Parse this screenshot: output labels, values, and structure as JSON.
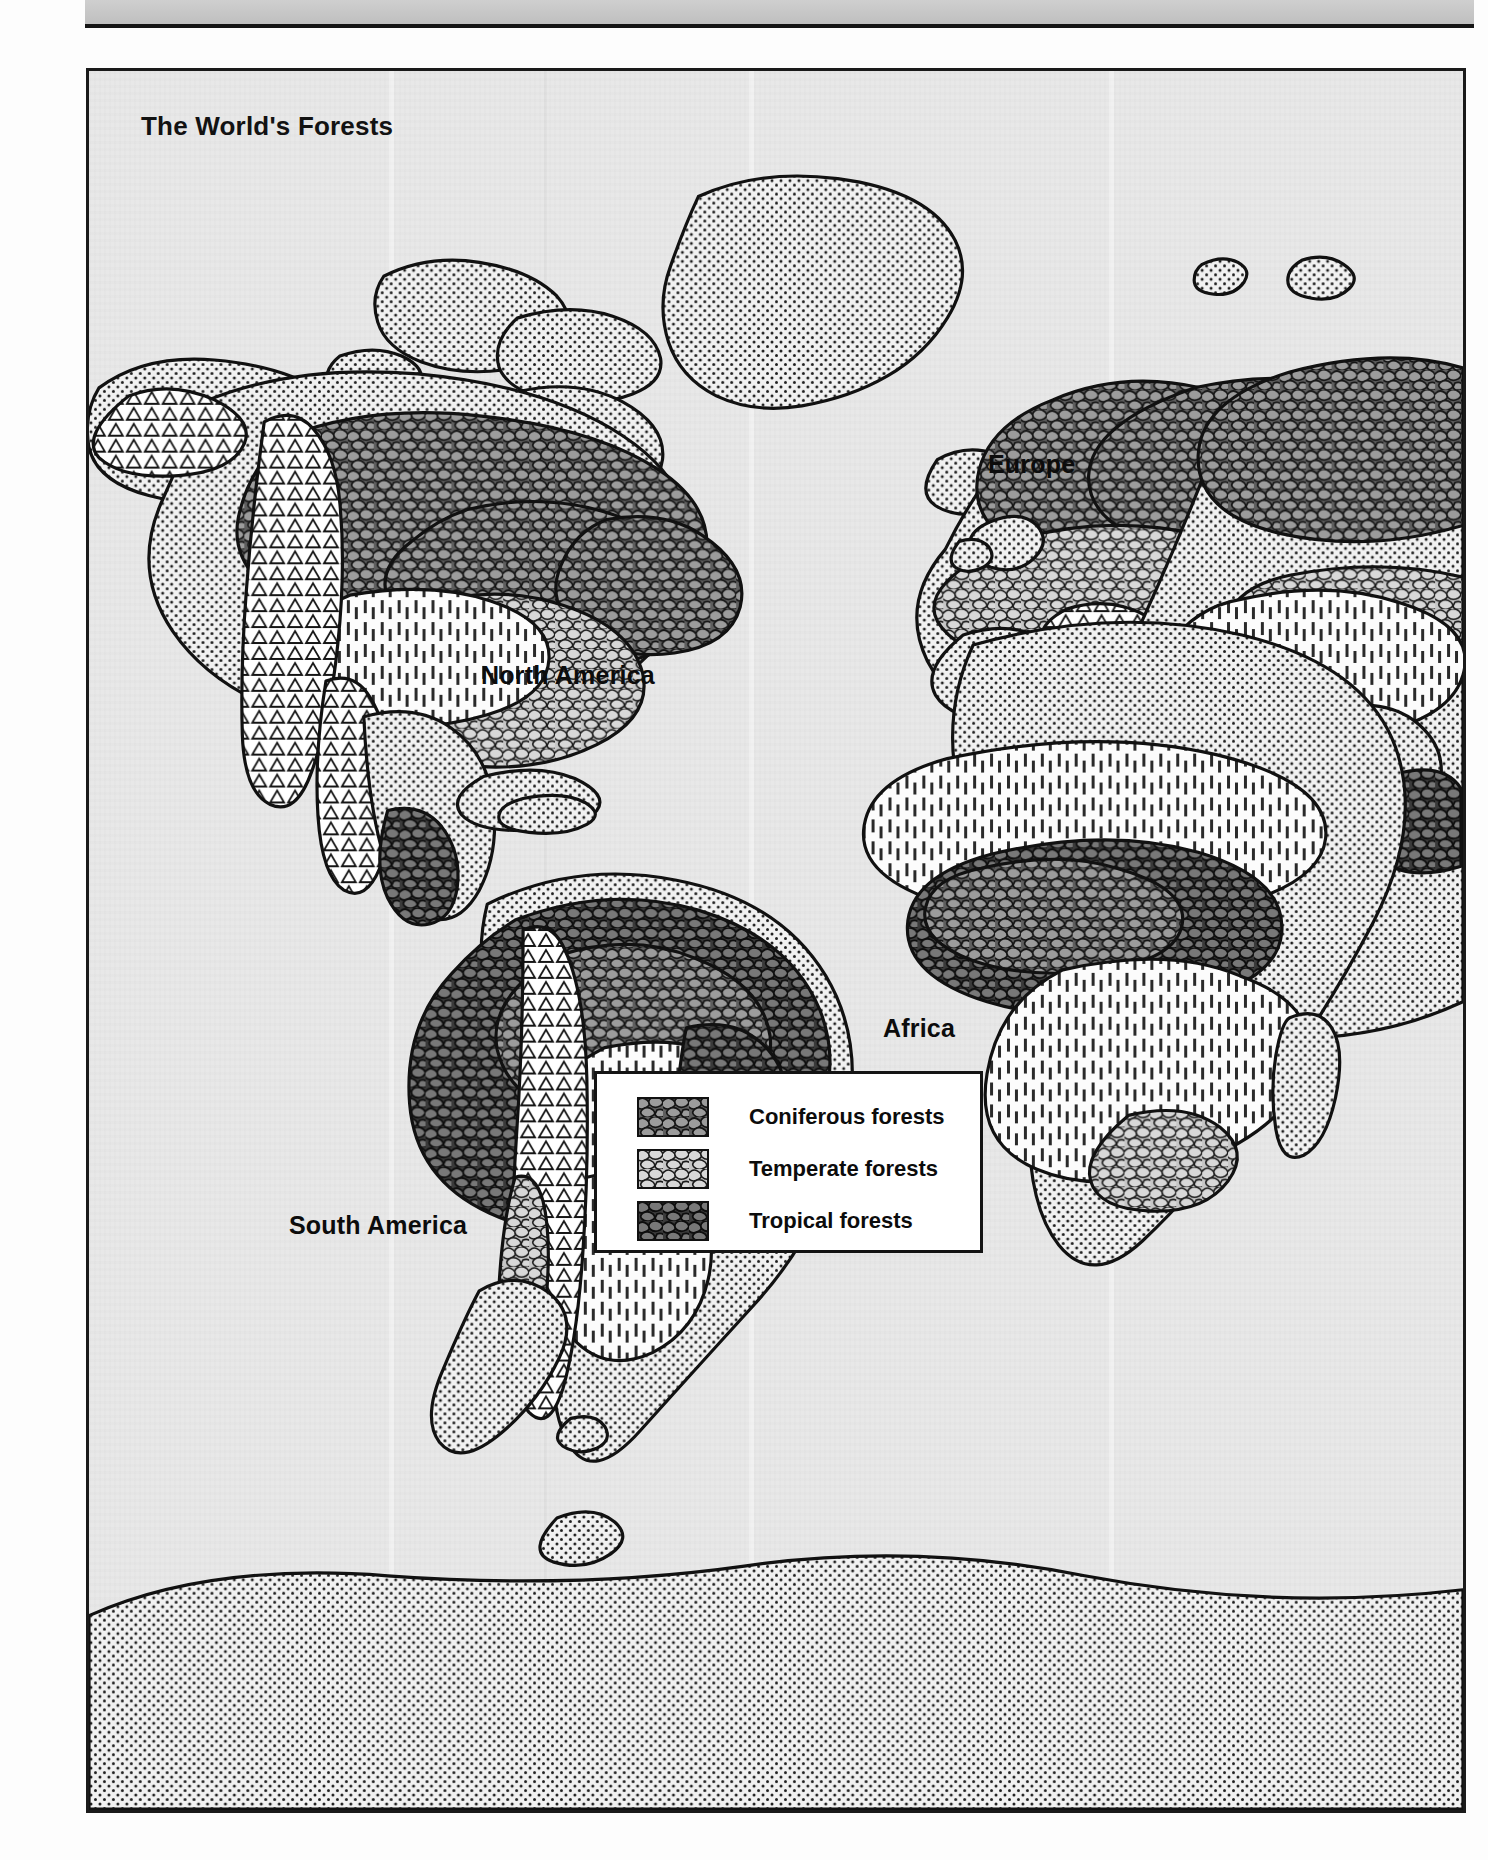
{
  "page": {
    "background_color": "#fdfdfd",
    "top_bar_color": "#c8c8c8"
  },
  "map": {
    "title": "The World's Forests",
    "frame_border_color": "#1a1a1a",
    "ocean_color": "#e8e8e8",
    "labels": [
      {
        "id": "north-america",
        "text": "North America"
      },
      {
        "id": "south-america",
        "text": "South America"
      },
      {
        "id": "europe",
        "text": "Europe"
      },
      {
        "id": "africa",
        "text": "Africa"
      }
    ]
  },
  "legend": {
    "entries": [
      {
        "label": "Coniferous forests",
        "fill": "#8e8e8e",
        "pattern": "cobblestone"
      },
      {
        "label": "Temperate forests",
        "fill": "#bdbdbd",
        "pattern": "cobblestone"
      },
      {
        "label": "Tropical forests",
        "fill": "#6f6f6f",
        "pattern": "cobblestone"
      }
    ],
    "border_color": "#141414",
    "background_color": "#ffffff"
  },
  "map_regions": [
    {
      "name": "North America",
      "forest_types": [
        "coniferous",
        "temperate",
        "tropical"
      ]
    },
    {
      "name": "South America",
      "forest_types": [
        "tropical",
        "temperate"
      ]
    },
    {
      "name": "Europe",
      "forest_types": [
        "coniferous",
        "temperate"
      ]
    },
    {
      "name": "Africa",
      "forest_types": [
        "tropical",
        "temperate"
      ]
    },
    {
      "name": "Asia",
      "forest_types": [
        "coniferous",
        "temperate",
        "tropical"
      ]
    },
    {
      "name": "Greenland",
      "forest_types": []
    },
    {
      "name": "Antarctica",
      "forest_types": []
    }
  ]
}
